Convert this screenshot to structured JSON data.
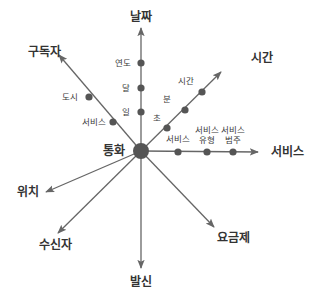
{
  "diagram": {
    "type": "star-schema-dimension-axes",
    "colors": {
      "line": "#666666",
      "dot": "#555555",
      "text": "#333333",
      "background": "#ffffff"
    },
    "center": {
      "label": "통화",
      "x": 141,
      "y": 151,
      "r": 8
    },
    "axes": [
      {
        "id": "date",
        "label": "날짜",
        "end": [
          141,
          28
        ],
        "label_pos": [
          141,
          21
        ],
        "arrow": true,
        "levels": [
          {
            "label": "일",
            "pos": [
              141,
              112
            ],
            "label_pos": [
              126,
              115
            ]
          },
          {
            "label": "달",
            "pos": [
              141,
              88
            ],
            "label_pos": [
              126,
              91
            ]
          },
          {
            "label": "연도",
            "pos": [
              141,
              63
            ],
            "label_pos": [
              123,
              66
            ]
          }
        ]
      },
      {
        "id": "time",
        "label": "시간",
        "end": [
          221,
          72
        ],
        "label_pos": [
          262,
          62
        ],
        "arrow": true,
        "levels": [
          {
            "label": "초",
            "pos": [
              167,
              128
            ],
            "label_pos": [
              157,
              121
            ]
          },
          {
            "label": "분",
            "pos": [
              185,
              110
            ],
            "label_pos": [
              167,
              102
            ]
          },
          {
            "label": "시간",
            "pos": [
              202,
              92
            ],
            "label_pos": [
              186,
              84
            ]
          }
        ]
      },
      {
        "id": "service",
        "label": "서비스",
        "end": [
          258,
          152
        ],
        "label_pos": [
          287,
          156
        ],
        "arrow": true,
        "levels": [
          {
            "label": "서비스",
            "pos": [
              178,
              152
            ],
            "label_pos": [
              178,
              142
            ]
          },
          {
            "label": "서비스\n유형",
            "pos": [
              207,
              152
            ],
            "label_pos": [
              207,
              133
            ]
          },
          {
            "label": "서비스\n범주",
            "pos": [
              233,
              152
            ],
            "label_pos": [
              233,
              133
            ]
          }
        ]
      },
      {
        "id": "subscriber",
        "label": "구독자",
        "end": [
          59,
          55
        ],
        "label_pos": [
          44,
          56
        ],
        "arrow": true,
        "levels": [
          {
            "label": "서비스",
            "pos": [
              113,
              122
            ],
            "label_pos": [
              94,
              125
            ]
          },
          {
            "label": "도시",
            "pos": [
              89,
              97
            ],
            "label_pos": [
              70,
              100
            ]
          }
        ]
      },
      {
        "id": "plan",
        "label": "요금제",
        "end": [
          214,
          227
        ],
        "label_pos": [
          233,
          242
        ],
        "arrow": true,
        "levels": []
      },
      {
        "id": "caller",
        "label": "발신",
        "end": [
          141,
          268
        ],
        "label_pos": [
          141,
          286
        ],
        "arrow": true,
        "levels": []
      },
      {
        "id": "receiver",
        "label": "수신자",
        "end": [
          58,
          233
        ],
        "label_pos": [
          55,
          249
        ],
        "arrow": true,
        "levels": []
      },
      {
        "id": "location",
        "label": "위치",
        "end": [
          46,
          192
        ],
        "label_pos": [
          28,
          196
        ],
        "arrow": true,
        "levels": []
      }
    ]
  }
}
